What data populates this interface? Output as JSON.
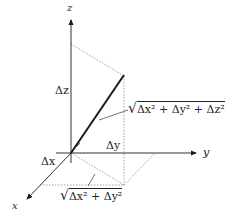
{
  "diagram": {
    "axes": {
      "x_label": "x",
      "y_label": "y",
      "z_label": "z"
    },
    "components": {
      "dx_label": "Δx",
      "dy_label": "Δy",
      "dz_label": "Δz"
    },
    "formulas": {
      "distance_3d": "√(Δx² + Δy² + Δz²)",
      "distance_3d_parts": {
        "radical": "√",
        "body": "Δx² + Δy² + Δz²"
      },
      "distance_2d": "√(Δx² + Δy²)",
      "distance_2d_parts": {
        "radical": "√",
        "body": "Δx² + Δy²"
      }
    },
    "colors": {
      "line": "#1a1a1a",
      "dotted": "#888888",
      "background": "#ffffff"
    }
  }
}
